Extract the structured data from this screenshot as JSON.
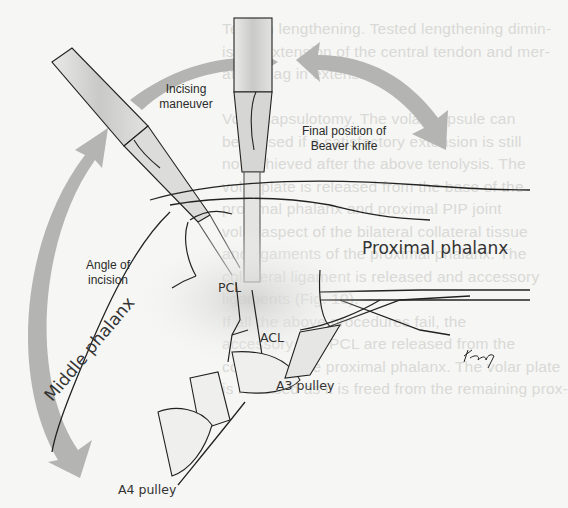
{
  "figure": {
    "type": "surgical illustration",
    "labels": {
      "incising_maneuver": [
        "Incising",
        "maneuver"
      ],
      "final_position": [
        "Final position of",
        "Beaver knife"
      ],
      "angle_of_incision": [
        "Angle of",
        "incision"
      ],
      "pcl": "PCL",
      "acl": "ACL",
      "proximal_phalanx": "Proximal phalanx",
      "middle_phalanx": "Middle phalanx",
      "a3_pulley": "A3 pulley",
      "a4_pulley": "A4 pulley",
      "signature": "Kimy"
    },
    "colors": {
      "arrow_gray": "#b4b4b2",
      "line": "#222222",
      "background": "#f6f6f4",
      "bleed_text": "#d9d9d6"
    }
  },
  "bleed_through_text": [
    "Tendon lengthening. Tested lengthening dimin-",
    "ishes extension of the central tendon and mer-",
    "ates a lag in extension.",
    "",
    "Volar capsulotomy. The volar capsule can",
    "be incised if a satisfactory extension is still",
    "not achieved after the above tenolysis. The",
    "volar plate is released from the base of the",
    "proximal phalanx and proximal PIP joint",
    "volar aspect of the bilateral collateral tissue",
    "and ligaments of the proximal phalanx. The",
    "collateral ligament is released and accessory",
    "ligaments (Fig. 10).",
    "  If all the above procedures fail, the",
    "accessory and PCL are released from the",
    "condyle of the proximal phalanx. The volar plate",
    "is released as it is freed from the remaining prox-"
  ]
}
